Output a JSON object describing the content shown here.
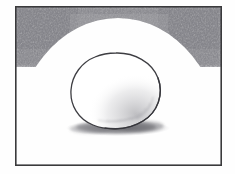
{
  "artwork": {
    "title": "Still life pencil sketch of an egg",
    "medium": "graphite pencil on white paper",
    "alt_text": "A hand-drawn pencil sketch showing a single egg-shaped oval resting on a flat surface with a soft cast shadow beneath it, enclosed by a thin rectangular border, with dense graphite shading sweeping in an arc across the top of the frame from both upper corners."
  },
  "canvas": {
    "width": 235,
    "height": 174,
    "paper_color": "#fefefe",
    "margin_color": "#ffffff"
  },
  "frame": {
    "name": "rectangular border",
    "x": 15,
    "y": 6,
    "width": 207,
    "height": 160,
    "stroke_color": "#3a3a3c",
    "stroke_width": 1.6
  },
  "background_shading": {
    "name": "arc of graphite shading across top",
    "color": "#55555a",
    "corner_darkness": 0.82,
    "center_darkness": 0.34,
    "arc_center_x": 118,
    "arc_center_y": 150,
    "arc_radius_x": 106,
    "arc_radius_y": 132,
    "band_depth_at_corners": 38,
    "band_depth_at_center": 9
  },
  "egg": {
    "name": "egg outline",
    "center_x": 116,
    "center_y": 91,
    "radius_x": 45,
    "radius_y": 38,
    "tilt_degrees": -8,
    "outline_color": "#3d3d42",
    "outline_width": 1.3,
    "fill_color": "#ffffff",
    "form_shadow": {
      "name": "form shading on lower right of egg",
      "color": "#8d8d93",
      "opacity": 0.45
    }
  },
  "cast_shadow": {
    "name": "cast shadow under egg",
    "center_x": 118,
    "center_y": 128,
    "radius_x": 52,
    "radius_y": 8,
    "color": "#6e6e74",
    "opacity": 0.72
  },
  "chart_data": {
    "type": "scatter",
    "xlabel": "",
    "ylabel": "",
    "categories": [
      "frame",
      "top shading arc",
      "egg",
      "cast shadow"
    ],
    "values": [
      1,
      1,
      1,
      1
    ]
  }
}
